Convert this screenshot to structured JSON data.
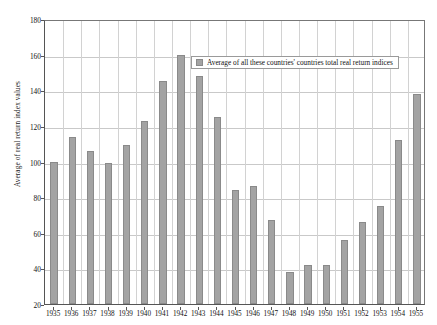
{
  "chart_data": {
    "type": "bar",
    "title": "",
    "subtitle": "",
    "xlabel": "",
    "ylabel": "Average of real return index values",
    "ylim": [
      20,
      180
    ],
    "ytick_step": 20,
    "yticks": [
      20,
      40,
      60,
      80,
      100,
      120,
      140,
      160,
      180
    ],
    "grid": true,
    "legend_position": "inside-top-right",
    "legend": [
      "Average of all these countries' countries total real return indices"
    ],
    "categories": [
      "1935",
      "1936",
      "1937",
      "1938",
      "1939",
      "1940",
      "1941",
      "1942",
      "1943",
      "1944",
      "1945",
      "1946",
      "1947",
      "1948",
      "1949",
      "1950",
      "1951",
      "1952",
      "1953",
      "1954",
      "1955"
    ],
    "values": [
      100,
      114,
      106,
      99,
      109,
      123,
      145,
      160,
      148,
      125,
      84,
      86,
      67,
      38,
      42,
      42,
      56,
      66,
      75,
      112,
      138
    ],
    "series": [
      {
        "name": "Average of all these countries' countries total real return indices",
        "color": "#a3a3a3",
        "values": [
          100,
          114,
          106,
          99,
          109,
          123,
          145,
          160,
          148,
          125,
          84,
          86,
          67,
          38,
          42,
          42,
          56,
          66,
          75,
          112,
          138
        ]
      }
    ]
  },
  "axes": {
    "y_title": "Average of real return index values"
  },
  "colors": {
    "bar_fill": "#a3a3a3",
    "bar_stroke": "#8a8a8a",
    "gridline": "#c9c9c9",
    "axis": "#555555",
    "text": "#111111",
    "background": "#ffffff"
  }
}
